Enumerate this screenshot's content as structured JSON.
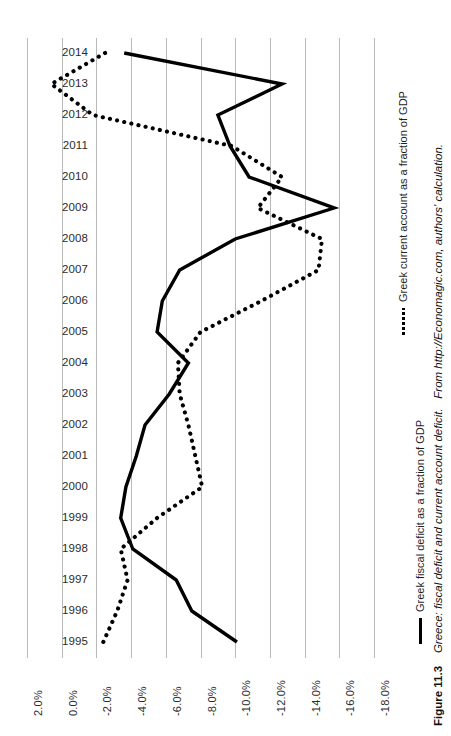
{
  "figure": {
    "number_label": "Figure 11.3",
    "title": "Greece: fiscal deficit and current account deficit.",
    "source": "From http://Economagic.com, authors' calculation."
  },
  "legend": {
    "position": "right",
    "entries": [
      {
        "key": "fiscal",
        "marker": "solid-line",
        "label": "Greek fiscal deficit as a fraction of GDP"
      },
      {
        "key": "current_account",
        "marker": "dotted-line",
        "label": "Greek current account as a fraction of GDP"
      }
    ]
  },
  "axes": {
    "value_axis_ticks": [
      "2.0%",
      "0.0%",
      "-2.0%",
      "-4.0%",
      "-6.0%",
      "-8.0%",
      "-10.0%",
      "-12.0%",
      "-14.0%",
      "-16.0%",
      "-18.0%"
    ],
    "category_axis_ticks": [
      "2014",
      "2013",
      "2012",
      "2011",
      "2010",
      "2009",
      "2008",
      "2007",
      "2006",
      "2005",
      "2004",
      "2003",
      "2002",
      "2001",
      "2000",
      "1999",
      "1998",
      "1997",
      "1996",
      "1995"
    ]
  },
  "colors": {
    "series": "#000000",
    "gridline": "#b9b9b9",
    "text": "#1f1f1f",
    "background": "#ffffff"
  },
  "chart_data": {
    "type": "line",
    "orientation": "horizontal-value-axis",
    "title": "Greece: fiscal deficit and current account deficit.",
    "xlabel": "",
    "ylabel": "",
    "grid": true,
    "legend_position": "right",
    "xlim": [
      2.0,
      -18.0
    ],
    "xticks": [
      2.0,
      0.0,
      -2.0,
      -4.0,
      -6.0,
      -8.0,
      -10.0,
      -12.0,
      -14.0,
      -16.0,
      -18.0
    ],
    "categories": [
      "2014",
      "2013",
      "2012",
      "2011",
      "2010",
      "2009",
      "2008",
      "2007",
      "2006",
      "2005",
      "2004",
      "2003",
      "2002",
      "2001",
      "2000",
      "1999",
      "1998",
      "1997",
      "1996",
      "1995"
    ],
    "series": [
      {
        "name": "Greek fiscal deficit as a fraction of GDP",
        "style": "solid",
        "values": [
          -3.6,
          -12.7,
          -9.0,
          -9.7,
          -10.8,
          -15.7,
          -10.0,
          -6.8,
          -5.8,
          -5.5,
          -7.3,
          -6.2,
          -4.8,
          -4.3,
          -3.7,
          -3.4,
          -4.1,
          -6.6,
          -7.5,
          -10.1
        ]
      },
      {
        "name": "Greek current account as a fraction of GDP",
        "style": "dotted",
        "values": [
          -2.5,
          0.6,
          -1.8,
          -9.8,
          -12.7,
          -11.3,
          -15.0,
          -14.8,
          -11.5,
          -8.0,
          -6.7,
          -6.8,
          -7.3,
          -7.7,
          -8.1,
          -5.5,
          -3.4,
          -3.8,
          -3.2,
          -2.4
        ]
      }
    ]
  }
}
